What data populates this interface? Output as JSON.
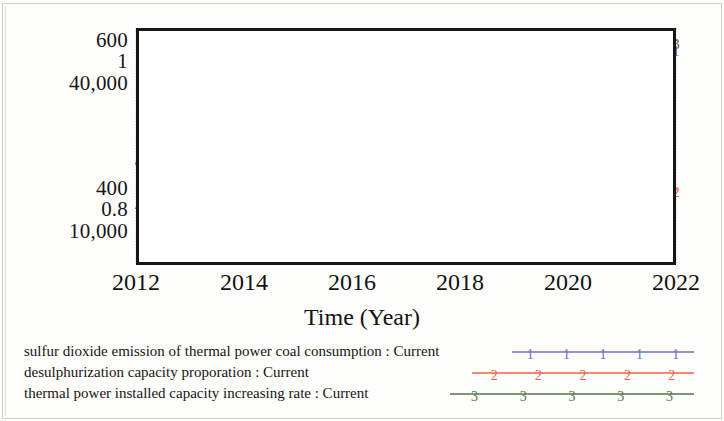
{
  "chart_data": {
    "type": "line",
    "title": "",
    "xlabel": "Time (Year)",
    "ylabel": "",
    "grid": true,
    "legend_position": "bottom",
    "x": [
      2012,
      2013,
      2014,
      2015,
      2016,
      2017,
      2018,
      2019,
      2020,
      2021,
      2022
    ],
    "xtick_labels": [
      "2012",
      "2014",
      "2016",
      "2018",
      "2020",
      "2022"
    ],
    "xlim": [
      2012,
      2022
    ],
    "y_axis_labels_top": [
      "600",
      "1",
      "40,000"
    ],
    "y_axis_labels_bottom": [
      "400",
      "0.8",
      "10,000"
    ],
    "series": [
      {
        "name": "sulfur dioxide emission of thermal power coal consumption : Current",
        "marker": "1",
        "color": "#6f6fc6",
        "ylim": [
          400,
          600
        ],
        "values": [
          486,
          519,
          511,
          504,
          506,
          503,
          505,
          513,
          529,
          556,
          583
        ]
      },
      {
        "name": "desulphurization capacity proporation : Current",
        "marker": "2",
        "color": "#ea6247",
        "ylim": [
          0.8,
          1.0
        ],
        "values": [
          0.885,
          0.897,
          0.903,
          0.906,
          0.908,
          0.908,
          0.906,
          0.899,
          0.89,
          0.878,
          0.864
        ]
      },
      {
        "name": "thermal power installed capacity increasing rate : Current",
        "marker": "3",
        "color": "#55754d",
        "ylim": [
          10000,
          40000
        ],
        "values": [
          17200,
          16100,
          19900,
          23700,
          27500,
          31300,
          30500,
          33400,
          36800,
          39400,
          38400
        ]
      }
    ]
  },
  "axis": {
    "y_top_stack": [
      "600",
      "1",
      "40,000"
    ],
    "y_bottom_stack": [
      "400",
      "0.8",
      "10,000"
    ],
    "x_ticks": [
      "2012",
      "2014",
      "2016",
      "2018",
      "2020",
      "2022"
    ],
    "x_title": "Time (Year)"
  },
  "legend": {
    "rows": [
      {
        "label": "sulfur dioxide emission of thermal power coal consumption : Current",
        "marker": "1",
        "color": "#6f6fc6"
      },
      {
        "label": "desulphurization capacity proporation : Current",
        "marker": "2",
        "color": "#ea6247"
      },
      {
        "label": "thermal power installed capacity increasing rate : Current",
        "marker": "3",
        "color": "#55754d"
      }
    ]
  }
}
